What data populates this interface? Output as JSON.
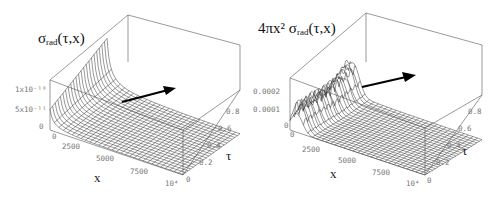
{
  "chart_data": [
    {
      "type": "surface3d",
      "title_main": "σ",
      "title_sub": "rad",
      "title_args": "(τ,x)",
      "xlabel": "x",
      "ylabel": "τ",
      "zlabel": "σ_rad(τ,x)",
      "x_ticks": [
        "0",
        "2500",
        "5000",
        "7500",
        "10⁴"
      ],
      "y_ticks": [
        "0",
        "0.2",
        "0.4",
        "0.6",
        "0.8"
      ],
      "z_ticks": [
        "0",
        "5x10⁻¹¹",
        "1x10⁻¹⁰"
      ],
      "xlim": [
        0,
        10000
      ],
      "ylim": [
        0,
        1
      ],
      "zlim": [
        0,
        1.5e-10
      ],
      "description": "Surface sharply peaked near x=0, decaying to ~0 for larger x; arrow indicates direction across the surface"
    },
    {
      "type": "surface3d",
      "title_prefix": "4πx² σ",
      "title_sub": "rad",
      "title_args": "(τ,x)",
      "xlabel": "x",
      "ylabel": "τ",
      "zlabel": "4πx² σ_rad(τ,x)",
      "x_ticks": [
        "0",
        "2500",
        "5000",
        "7500",
        "10⁴"
      ],
      "y_ticks": [
        "0",
        "0.2",
        "0.4",
        "0.6",
        "0.8"
      ],
      "z_ticks": [
        "0",
        "0.0001",
        "0.0002"
      ],
      "xlim": [
        0,
        10000
      ],
      "ylim": [
        0,
        1
      ],
      "zlim": [
        0,
        0.0003
      ],
      "description": "Surface with ridge near small x (oscillating along τ), rising toward τ=1 at x=0; arrow indicates direction across surface"
    }
  ]
}
